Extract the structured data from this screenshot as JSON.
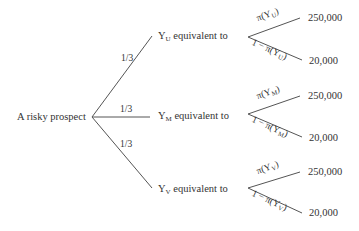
{
  "root": {
    "label": "A risky prospect"
  },
  "branches": [
    {
      "probability": "1/3",
      "node": {
        "prefix": "Y",
        "subscript": "U",
        "suffix": " equivalent to"
      },
      "outcomes": [
        {
          "prob_prefix": "π(Y",
          "prob_sub": "U",
          "prob_suffix": ")",
          "value": "250,000"
        },
        {
          "prob_prefix": "1 − π(Y",
          "prob_sub": "U",
          "prob_suffix": ")",
          "value": "20,000"
        }
      ]
    },
    {
      "probability": "1/3",
      "node": {
        "prefix": "Y",
        "subscript": "M",
        "suffix": " equivalent to"
      },
      "outcomes": [
        {
          "prob_prefix": "π(Y",
          "prob_sub": "M",
          "prob_suffix": ")",
          "value": "250,000"
        },
        {
          "prob_prefix": "1 − π(Y",
          "prob_sub": "M",
          "prob_suffix": ")",
          "value": "20,000"
        }
      ]
    },
    {
      "probability": "1/3",
      "node": {
        "prefix": "Y",
        "subscript": "V",
        "suffix": " equivalent to"
      },
      "outcomes": [
        {
          "prob_prefix": "π(Y",
          "prob_sub": "V",
          "prob_suffix": ")",
          "value": "250,000"
        },
        {
          "prob_prefix": "1 − π(Y",
          "prob_sub": "V",
          "prob_suffix": ")",
          "value": "20,000"
        }
      ]
    }
  ],
  "colors": {
    "line": "#555555",
    "text": "#333333"
  }
}
